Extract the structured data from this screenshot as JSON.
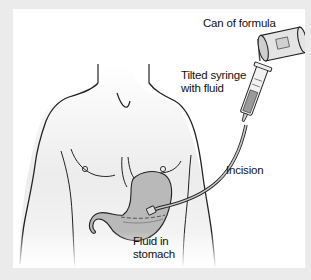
{
  "diagram": {
    "labels": {
      "can": "Can of formula",
      "syringe": [
        "Tilted syringe",
        "with fluid"
      ],
      "incision": "Incision",
      "fluid": [
        "Fluid in",
        "stomach"
      ]
    },
    "colors": {
      "frame": "#ebebeb",
      "panel": "#ffffff",
      "outline": "#222222",
      "stomach": "#b9b9b9",
      "skin_shade": "#e6e6e6"
    }
  }
}
